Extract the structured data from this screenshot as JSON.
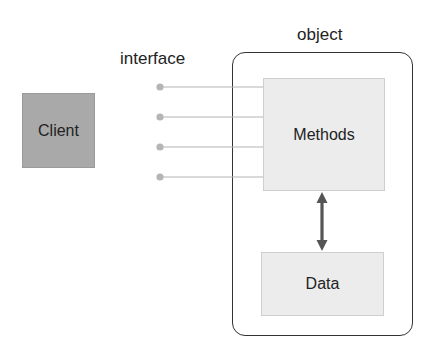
{
  "diagram": {
    "client": {
      "label": "Client"
    },
    "interface": {
      "label": "interface",
      "connectors": [
        {
          "y": 87
        },
        {
          "y": 117
        },
        {
          "y": 147
        },
        {
          "y": 177
        }
      ]
    },
    "object": {
      "label": "object",
      "methods": {
        "label": "Methods"
      },
      "data": {
        "label": "Data"
      },
      "link": {
        "type": "bidirectional-arrow",
        "from": "Methods",
        "to": "Data"
      }
    },
    "colors": {
      "client_fill": "#a9a9a9",
      "inner_box_fill": "#ececec",
      "connector": "#b3b3b3",
      "border": "#333333",
      "arrow": "#555555"
    }
  }
}
